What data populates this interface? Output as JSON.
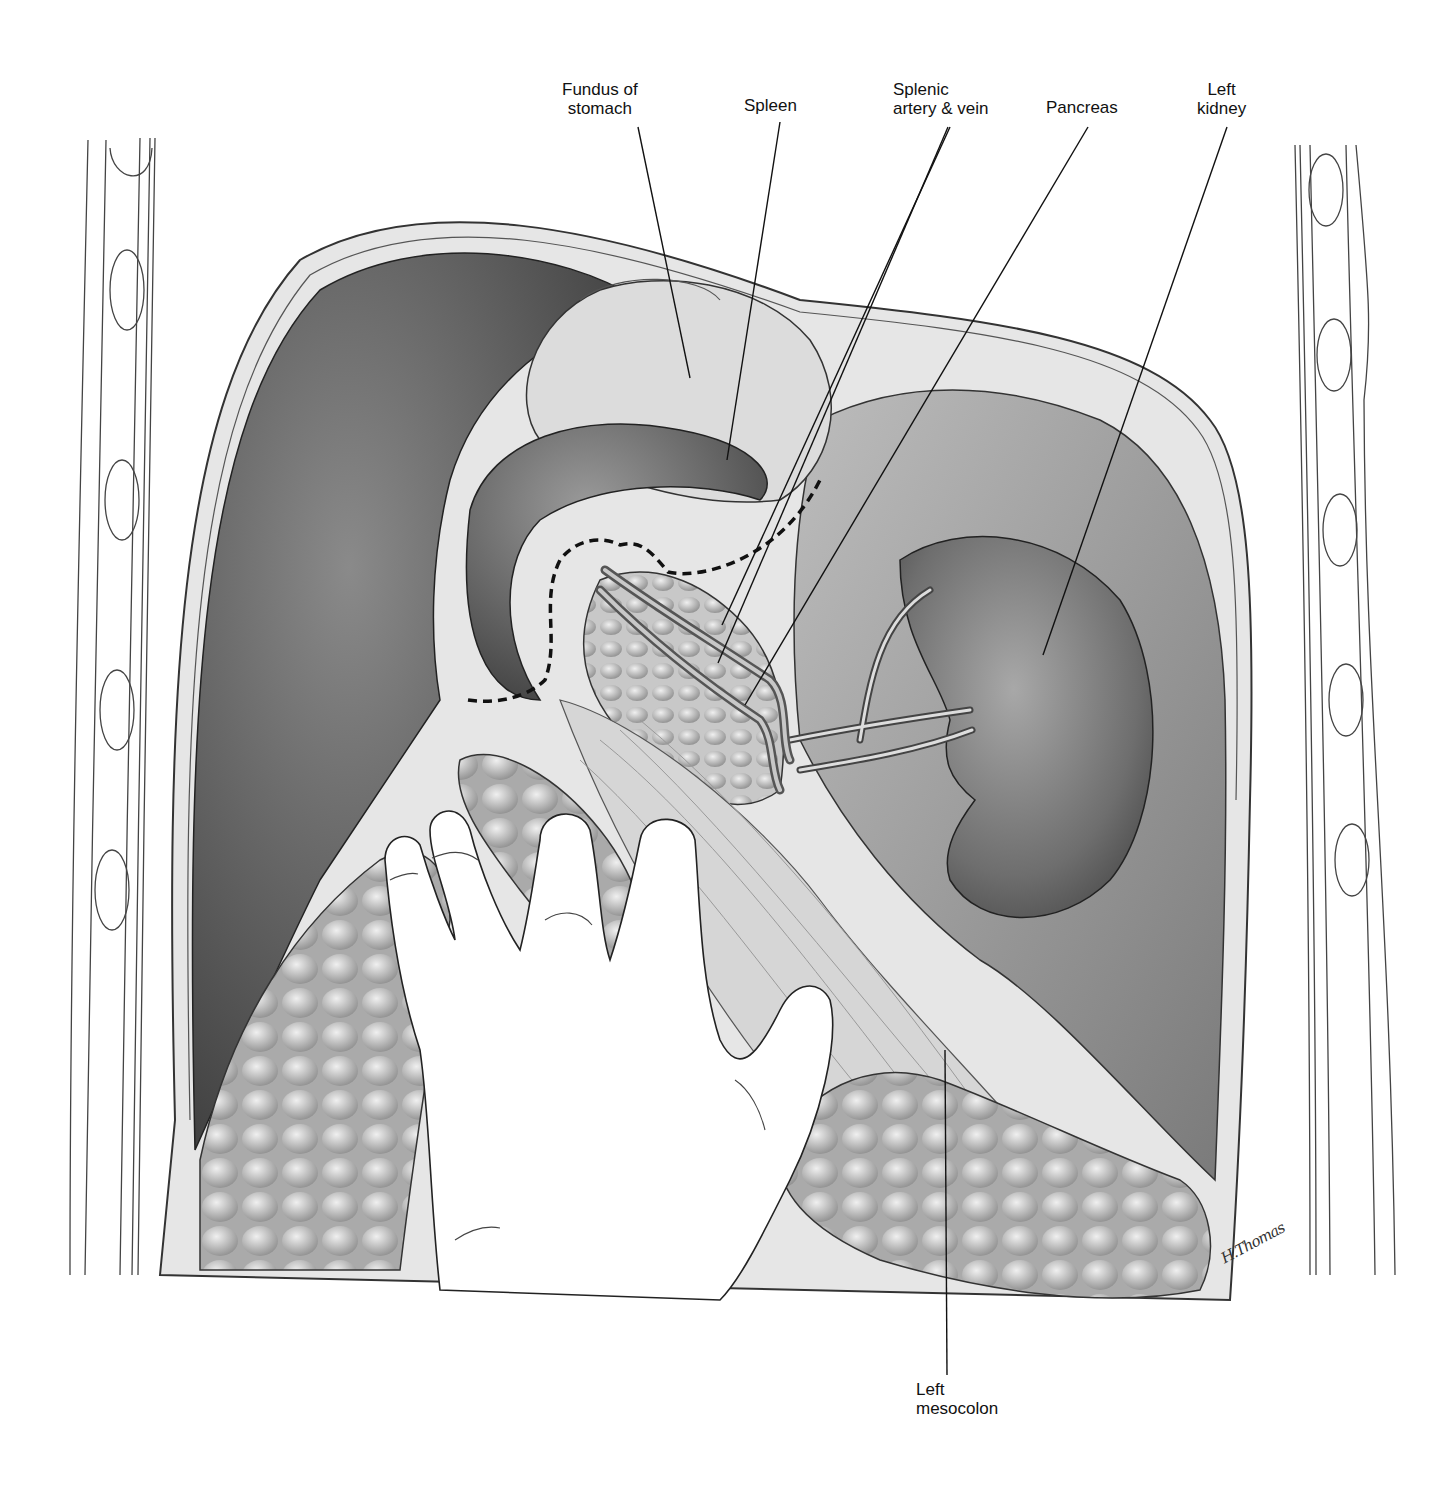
{
  "figure": {
    "type": "anatomical illustration",
    "palette": {
      "ink": "#111111",
      "tissue_dark": "#4a4a4a",
      "tissue_mid": "#8c8c8c",
      "tissue_light": "#d2d2d2",
      "background": "#ffffff",
      "dashed_line": "#111111"
    }
  },
  "labels": [
    {
      "id": "fundus",
      "text": "Fundus of\nstomach",
      "x": 562,
      "y": 87,
      "anchor": [
        638,
        127
      ],
      "target": [
        690,
        378
      ]
    },
    {
      "id": "spleen",
      "text": "Spleen",
      "x": 744,
      "y": 96,
      "anchor": [
        780,
        122
      ],
      "target": [
        727,
        460
      ]
    },
    {
      "id": "splenic-vessels",
      "text": "Splenic\nartery & vein",
      "x": 893,
      "y": 80,
      "anchor": [
        950,
        127
      ],
      "targets": [
        [
          722,
          625
        ],
        [
          720,
          663
        ]
      ]
    },
    {
      "id": "pancreas",
      "text": "Pancreas",
      "x": 1046,
      "y": 98,
      "anchor": [
        1088,
        127
      ],
      "target": [
        745,
        705
      ]
    },
    {
      "id": "left-kidney",
      "text": "Left\nkidney",
      "x": 1197,
      "y": 80,
      "anchor": [
        1227,
        127
      ],
      "target": [
        1043,
        655
      ]
    },
    {
      "id": "left-mesocolon",
      "text": "Left\nmesocolon",
      "x": 916,
      "y": 1380,
      "anchor": [
        947,
        1375
      ],
      "target": [
        945,
        1050
      ]
    }
  ],
  "signature": {
    "text": "H.Thomas",
    "x": 1218,
    "y": 1244
  }
}
